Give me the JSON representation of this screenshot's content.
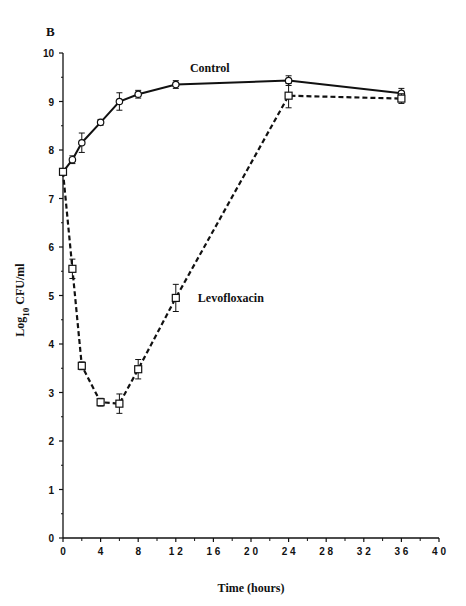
{
  "panel_label": "B",
  "chart_data": {
    "type": "line",
    "title": "",
    "xlabel": "Time (hours)",
    "ylabel": "Log 10 CFU/ml",
    "ylabel_parts": {
      "main": "Log",
      "subscript": "10",
      "unit": "CFU/ml"
    },
    "xlim": [
      0,
      40
    ],
    "ylim": [
      0,
      10
    ],
    "x_ticks": [
      0,
      4,
      8,
      12,
      16,
      20,
      24,
      28,
      32,
      36,
      40
    ],
    "x_tick_labels": [
      "0",
      "4",
      "8",
      "1 2",
      "1 6",
      "2 0",
      "2 4",
      "2 8",
      "3 2",
      "3 6",
      "4 0"
    ],
    "y_ticks": [
      0,
      1,
      2,
      3,
      4,
      5,
      6,
      7,
      8,
      9,
      10
    ],
    "grid": false,
    "legend": "inline labels",
    "series": [
      {
        "name": "Control",
        "marker": "circle",
        "line_style": "solid",
        "x": [
          0,
          1,
          2,
          4,
          6,
          8,
          12,
          24,
          36
        ],
        "values": [
          7.55,
          7.8,
          8.15,
          8.57,
          9.0,
          9.15,
          9.35,
          9.43,
          9.17
        ],
        "error": [
          0.05,
          0.08,
          0.2,
          0.06,
          0.18,
          0.08,
          0.08,
          0.1,
          0.1
        ],
        "label_position": {
          "x": 13.5,
          "y": 9.7
        }
      },
      {
        "name": "Levofloxacin",
        "marker": "square",
        "line_style": "dashed",
        "x": [
          0,
          1,
          2,
          4,
          6,
          8,
          12,
          24,
          36
        ],
        "values": [
          7.55,
          5.55,
          3.55,
          2.8,
          2.77,
          3.48,
          4.95,
          9.12,
          9.06
        ],
        "error": [
          0.05,
          0.2,
          0.08,
          0.08,
          0.2,
          0.2,
          0.28,
          0.25,
          0.1
        ],
        "label_position": {
          "x": 13.6,
          "y": 4.95
        }
      }
    ]
  }
}
